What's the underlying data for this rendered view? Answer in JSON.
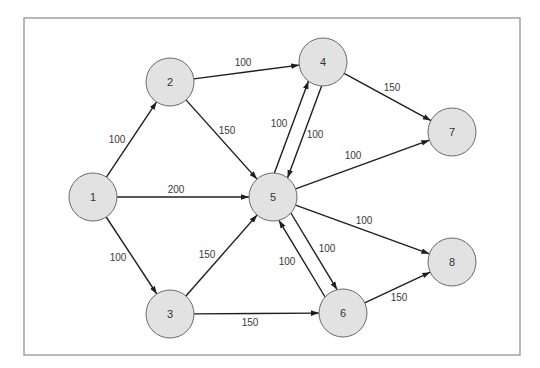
{
  "diagram": {
    "title": "",
    "type": "directed-weighted-network",
    "frame": {
      "x": 24,
      "y": 18,
      "width": 496,
      "height": 337
    },
    "colors": {
      "node_fill": "#e2e2e2",
      "node_stroke": "#6a6a6a",
      "edge": "#1e1e1e",
      "frame": "#8a8a8a",
      "label": "#3a3a3a"
    },
    "node_radius": 24,
    "nodes": [
      {
        "id": "1",
        "label": "1",
        "x": 93,
        "y": 197
      },
      {
        "id": "2",
        "label": "2",
        "x": 170,
        "y": 82
      },
      {
        "id": "3",
        "label": "3",
        "x": 170,
        "y": 314
      },
      {
        "id": "4",
        "label": "4",
        "x": 323,
        "y": 62
      },
      {
        "id": "5",
        "label": "5",
        "x": 273,
        "y": 197
      },
      {
        "id": "6",
        "label": "6",
        "x": 343,
        "y": 313
      },
      {
        "id": "7",
        "label": "7",
        "x": 452,
        "y": 132
      },
      {
        "id": "8",
        "label": "8",
        "x": 452,
        "y": 262
      }
    ],
    "edges": [
      {
        "from": "1",
        "to": "2",
        "weight": "100",
        "label_x": 117,
        "label_y": 139,
        "offset": 0
      },
      {
        "from": "1",
        "to": "5",
        "weight": "200",
        "label_x": 176,
        "label_y": 189,
        "offset": 0
      },
      {
        "from": "1",
        "to": "3",
        "weight": "100",
        "label_x": 118,
        "label_y": 257,
        "offset": 0
      },
      {
        "from": "2",
        "to": "4",
        "weight": "100",
        "label_x": 243,
        "label_y": 62,
        "offset": 0
      },
      {
        "from": "2",
        "to": "5",
        "weight": "150",
        "label_x": 227,
        "label_y": 130,
        "offset": 0
      },
      {
        "from": "3",
        "to": "5",
        "weight": "150",
        "label_x": 207,
        "label_y": 254,
        "offset": 0
      },
      {
        "from": "3",
        "to": "6",
        "weight": "150",
        "label_x": 250,
        "label_y": 322,
        "offset": 0
      },
      {
        "from": "4",
        "to": "5",
        "weight": "100",
        "label_x": 279,
        "label_y": 123,
        "offset": -7
      },
      {
        "from": "5",
        "to": "4",
        "weight": "100",
        "label_x": 315,
        "label_y": 134,
        "offset": -7
      },
      {
        "from": "4",
        "to": "7",
        "weight": "150",
        "label_x": 392,
        "label_y": 87,
        "offset": 0
      },
      {
        "from": "5",
        "to": "7",
        "weight": "100",
        "label_x": 353,
        "label_y": 155,
        "offset": 0
      },
      {
        "from": "5",
        "to": "8",
        "weight": "100",
        "label_x": 364,
        "label_y": 220,
        "offset": 0
      },
      {
        "from": "5",
        "to": "6",
        "weight": "100",
        "label_x": 287,
        "label_y": 261,
        "offset": -7
      },
      {
        "from": "6",
        "to": "5",
        "weight": "100",
        "label_x": 327,
        "label_y": 248,
        "offset": -7
      },
      {
        "from": "6",
        "to": "8",
        "weight": "150",
        "label_x": 399,
        "label_y": 297,
        "offset": 0
      }
    ]
  }
}
